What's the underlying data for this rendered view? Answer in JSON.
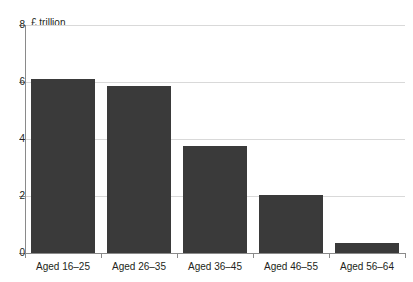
{
  "chart_data": {
    "type": "bar",
    "title": "",
    "subtitle": "",
    "xlabel": "",
    "ylabel": "£ trillion",
    "ylim": [
      0,
      8
    ],
    "ytick_labels": [
      "0",
      "2",
      "4",
      "6",
      "8"
    ],
    "ytick_values": [
      0,
      2,
      4,
      6,
      8
    ],
    "grid": true,
    "grid_axis": "y",
    "legend": false,
    "legend_position": "none",
    "bar_color": "#3a3a3a",
    "categories": [
      "Aged 16–25",
      "Aged 26–35",
      "Aged 36–45",
      "Aged 46–55",
      "Aged 56–64"
    ],
    "values": [
      6.1,
      5.85,
      3.75,
      2.05,
      0.35
    ]
  }
}
